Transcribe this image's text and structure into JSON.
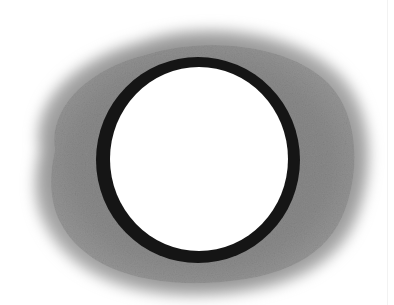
{
  "image": {
    "subject": "pencil drawing of a dark ring surrounded by a shaded grey halo",
    "colors": {
      "background": "#ffffff",
      "halo": "#8a8a8a",
      "halo_dark": "#6e6e6e",
      "ring": "#141414",
      "center": "#ffffff"
    }
  }
}
